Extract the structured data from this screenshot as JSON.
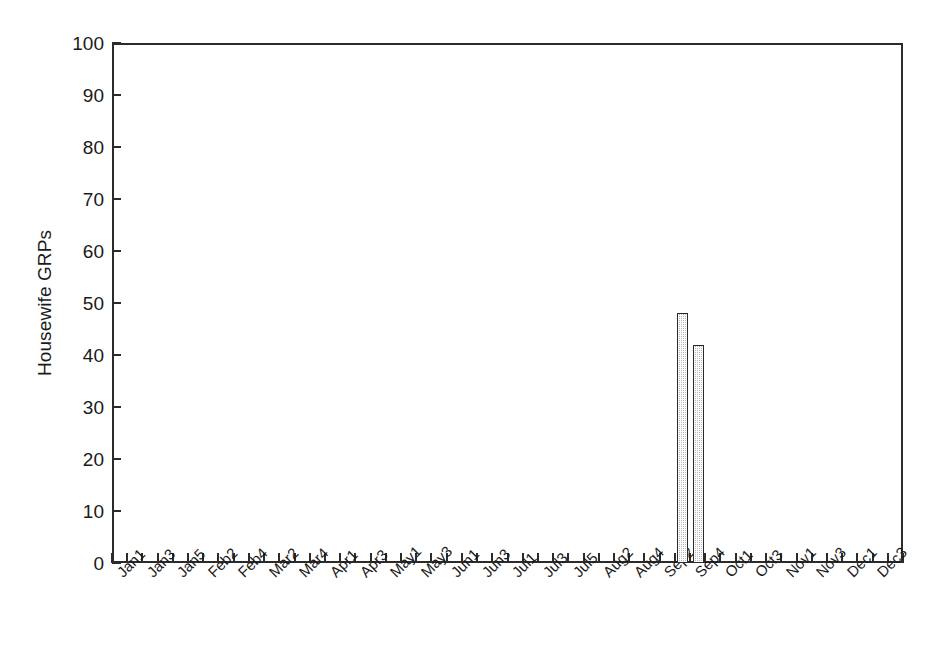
{
  "chart_data": {
    "type": "bar",
    "title": "",
    "xlabel": "",
    "ylabel": "Housewife GRPs",
    "ylim": [
      0,
      100
    ],
    "ytick_values": [
      0,
      10,
      20,
      30,
      40,
      50,
      60,
      70,
      80,
      90,
      100
    ],
    "ytick_labels": [
      "0",
      "10",
      "20",
      "30",
      "40",
      "50",
      "60",
      "70",
      "80",
      "90",
      "100"
    ],
    "grid": false,
    "legend": "none",
    "bar_color": "#b9b9b9",
    "bar_edge_color": "#2b2b2b",
    "axis_color": "#2b2b2b",
    "tick_label_mode": "every-other-tick",
    "categories": [
      "Jan1",
      "Jan2",
      "Jan3",
      "Jan4",
      "Jan5",
      "Feb1",
      "Feb2",
      "Feb3",
      "Feb4",
      "Mar1",
      "Mar2",
      "Mar3",
      "Mar4",
      "Apr1",
      "Apr2",
      "Apr3",
      "Apr4",
      "May1",
      "May2",
      "May3",
      "May4",
      "Jun1",
      "Jun2",
      "Jun3",
      "Jun4",
      "Jul1",
      "Jul2",
      "Jul3",
      "Jul4",
      "Jul5",
      "Aug1",
      "Aug2",
      "Aug3",
      "Aug4",
      "Sep1",
      "Sep2",
      "Sep3",
      "Sep4",
      "Oct1",
      "Oct2",
      "Oct3",
      "Oct4",
      "Nov1",
      "Nov2",
      "Nov3",
      "Nov4",
      "Dec1",
      "Dec2",
      "Dec3",
      "Dec4",
      "Dec5",
      "Dec6"
    ],
    "visible_tick_labels": [
      "Jan1",
      "Jan3",
      "Jan5",
      "Feb2",
      "Feb4",
      "Mar2",
      "Mar4",
      "Apr1",
      "Apr3",
      "May1",
      "May3",
      "Jun1",
      "Jun3",
      "Jul1",
      "Jul3",
      "Jul5",
      "Aug2",
      "Aug4",
      "Sep2",
      "Sep4",
      "Oct1",
      "Oct3",
      "Nov1",
      "Nov3",
      "Dec1",
      "Dec3"
    ],
    "values": [
      0,
      0,
      0,
      0,
      0,
      0,
      0,
      0,
      0,
      0,
      0,
      0,
      0,
      0,
      0,
      0,
      0,
      0,
      0,
      0,
      0,
      0,
      0,
      0,
      0,
      0,
      0,
      0,
      0,
      0,
      0,
      0,
      0,
      0,
      0,
      0,
      0,
      48,
      42,
      0,
      0,
      0,
      0,
      0,
      0,
      0,
      0,
      0,
      0,
      0,
      0,
      0
    ],
    "nonzero_points": [
      {
        "category": "Sep4",
        "value": 48
      },
      {
        "category": "Oct1",
        "value": 42
      }
    ]
  }
}
